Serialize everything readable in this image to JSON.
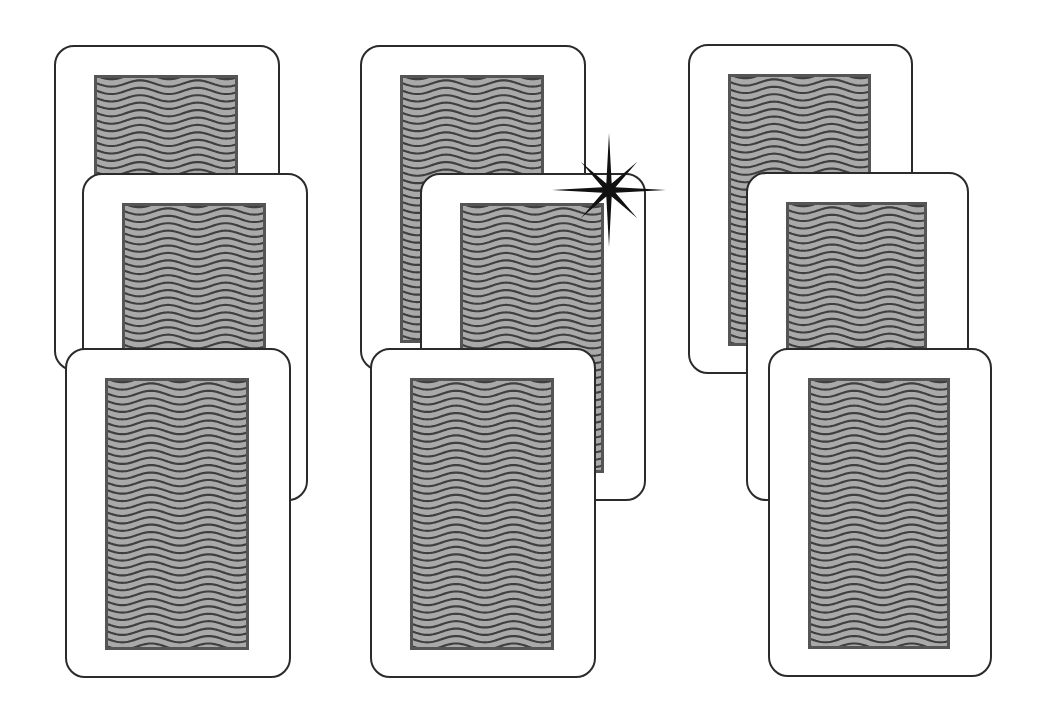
{
  "scene": {
    "title": "Card stacks",
    "background": "#ffffff",
    "card_border_color": "#2b2b2b",
    "card_face_color": "#ffffff",
    "back_fill_color": "#a9a9a9",
    "back_frame_color": "#555555",
    "back_wave_color": "#3f3f3f",
    "back_pattern": "wavy-lines"
  },
  "stacks": [
    {
      "name": "left",
      "cards": [
        {
          "position": "back",
          "face": "down",
          "x": 54,
          "y": 45,
          "w": 226,
          "h": 326
        },
        {
          "position": "middle",
          "face": "down",
          "x": 82,
          "y": 173,
          "w": 226,
          "h": 328
        },
        {
          "position": "front",
          "face": "down",
          "x": 65,
          "y": 348,
          "w": 226,
          "h": 330
        }
      ]
    },
    {
      "name": "middle",
      "cards": [
        {
          "position": "back",
          "face": "down",
          "x": 360,
          "y": 45,
          "w": 226,
          "h": 326
        },
        {
          "position": "middle",
          "face": "down",
          "x": 420,
          "y": 173,
          "w": 226,
          "h": 328,
          "highlighted": true
        },
        {
          "position": "front",
          "face": "down",
          "x": 370,
          "y": 348,
          "w": 226,
          "h": 330
        }
      ]
    },
    {
      "name": "right",
      "cards": [
        {
          "position": "back",
          "face": "down",
          "x": 688,
          "y": 44,
          "w": 225,
          "h": 330
        },
        {
          "position": "middle",
          "face": "down",
          "x": 746,
          "y": 172,
          "w": 223,
          "h": 329
        },
        {
          "position": "front",
          "face": "down",
          "x": 768,
          "y": 348,
          "w": 224,
          "h": 329
        }
      ]
    }
  ],
  "highlight": {
    "icon": "sparkle-star-icon",
    "color": "#111111",
    "center_x": 609,
    "center_y": 190,
    "attached_to": "middle stack, middle card"
  }
}
